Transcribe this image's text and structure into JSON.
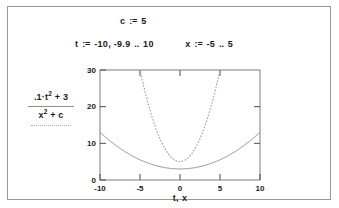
{
  "worksheet": {
    "definitions": [
      {
        "name": "constant-c",
        "lhs": "c",
        "operator": ":=",
        "rhs": "5"
      }
    ],
    "ranges": [
      {
        "name": "range-t",
        "lhs": "t",
        "operator": ":=",
        "start": "-10",
        "comma": ",",
        "second": "-9.9",
        "dots": "..",
        "end": "10"
      },
      {
        "name": "range-x",
        "lhs": "x",
        "operator": ":=",
        "start": "-5",
        "dots": "..",
        "end": "5"
      }
    ]
  },
  "plot": {
    "y_traces": [
      {
        "label_main": ".1·t",
        "label_sup": "2",
        "label_tail": " + 3",
        "style": "solid",
        "color": "#8f8f8f"
      },
      {
        "label_main": "x",
        "label_sup": "2",
        "label_tail": " + c",
        "style": "dotted",
        "color": "#a8a8a8"
      }
    ],
    "x_axis_title": "t, x",
    "x_ticks": [
      "-10",
      "-5",
      "0",
      "5",
      "10"
    ],
    "y_ticks": [
      "0",
      "10",
      "20",
      "30"
    ]
  },
  "chart_data": {
    "type": "line",
    "title": "",
    "xlabel": "t, x",
    "ylabel": "",
    "xlim": [
      -10,
      10
    ],
    "ylim": [
      0,
      30
    ],
    "xticks": [
      -10,
      -5,
      0,
      5,
      10
    ],
    "yticks": [
      0,
      10,
      20,
      30
    ],
    "grid": false,
    "legend_position": "left",
    "series": [
      {
        "name": ".1·t^2 + 3",
        "style": "solid",
        "color": "#8f8f8f",
        "x": [
          -10,
          -9,
          -8,
          -7,
          -6,
          -5,
          -4,
          -3,
          -2,
          -1,
          0,
          1,
          2,
          3,
          4,
          5,
          6,
          7,
          8,
          9,
          10
        ],
        "values": [
          13,
          11.1,
          9.4,
          7.9,
          6.6,
          5.5,
          4.6,
          3.9,
          3.4,
          3.1,
          3,
          3.1,
          3.4,
          3.9,
          4.6,
          5.5,
          6.6,
          7.9,
          9.4,
          11.1,
          13
        ]
      },
      {
        "name": "x^2 + c",
        "style": "dotted",
        "color": "#a8a8a8",
        "x": [
          -5,
          -4.5,
          -4,
          -3.5,
          -3,
          -2.5,
          -2,
          -1.5,
          -1,
          -0.5,
          0,
          0.5,
          1,
          1.5,
          2,
          2.5,
          3,
          3.5,
          4,
          4.5,
          5
        ],
        "values": [
          30,
          25.25,
          21,
          17.25,
          14,
          11.25,
          9,
          7.25,
          6,
          5.25,
          5,
          5.25,
          6,
          7.25,
          9,
          11.25,
          14,
          17.25,
          21,
          25.25,
          30
        ]
      }
    ]
  }
}
